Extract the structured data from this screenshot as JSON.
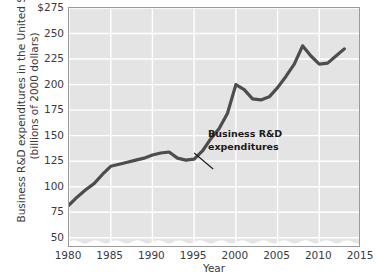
{
  "chart_data": {
    "type": "line",
    "title": "",
    "xlabel": "Year",
    "ylabel_line1": "Business R&D expenditures in the United States",
    "ylabel_line2": "(billions of 2000 dollars)",
    "xlim": [
      1980,
      2015
    ],
    "ylim": [
      40,
      275
    ],
    "grid": true,
    "legend_position": "none",
    "axis_break": "wavy break near bottom of y-axis below 50",
    "xticks": [
      "1980",
      "1985",
      "1990",
      "1995",
      "2000",
      "2005",
      "2010",
      "2015"
    ],
    "xtick_values": [
      1980,
      1985,
      1990,
      1995,
      2000,
      2005,
      2010,
      2015
    ],
    "yticks": [
      "50",
      "75",
      "100",
      "125",
      "150",
      "175",
      "200",
      "225",
      "250",
      "$275"
    ],
    "ytick_values": [
      50,
      75,
      100,
      125,
      150,
      175,
      200,
      225,
      250,
      275
    ],
    "series": [
      {
        "name": "Business R&D expenditures",
        "color": "#4d4d4d",
        "x": [
          1980,
          1981,
          1982,
          1983,
          1984,
          1985,
          1986,
          1987,
          1988,
          1989,
          1990,
          1991,
          1992,
          1993,
          1994,
          1995,
          1996,
          1997,
          1998,
          1999,
          2000,
          2001,
          2002,
          2003,
          2004,
          2005,
          2006,
          2007,
          2008,
          2009,
          2010,
          2011,
          2012,
          2013
        ],
        "values": [
          82,
          90,
          97,
          103,
          112,
          120,
          122,
          124,
          126,
          128,
          131,
          133,
          134,
          128,
          126,
          127,
          135,
          147,
          157,
          172,
          200,
          195,
          186,
          185,
          188,
          197,
          208,
          220,
          238,
          228,
          220,
          221,
          228,
          235
        ]
      }
    ],
    "annotations": [
      {
        "label_line1": "Business R&D",
        "label_line2": "expenditures",
        "points_to_year": 1995,
        "points_to_value": 133
      }
    ]
  }
}
